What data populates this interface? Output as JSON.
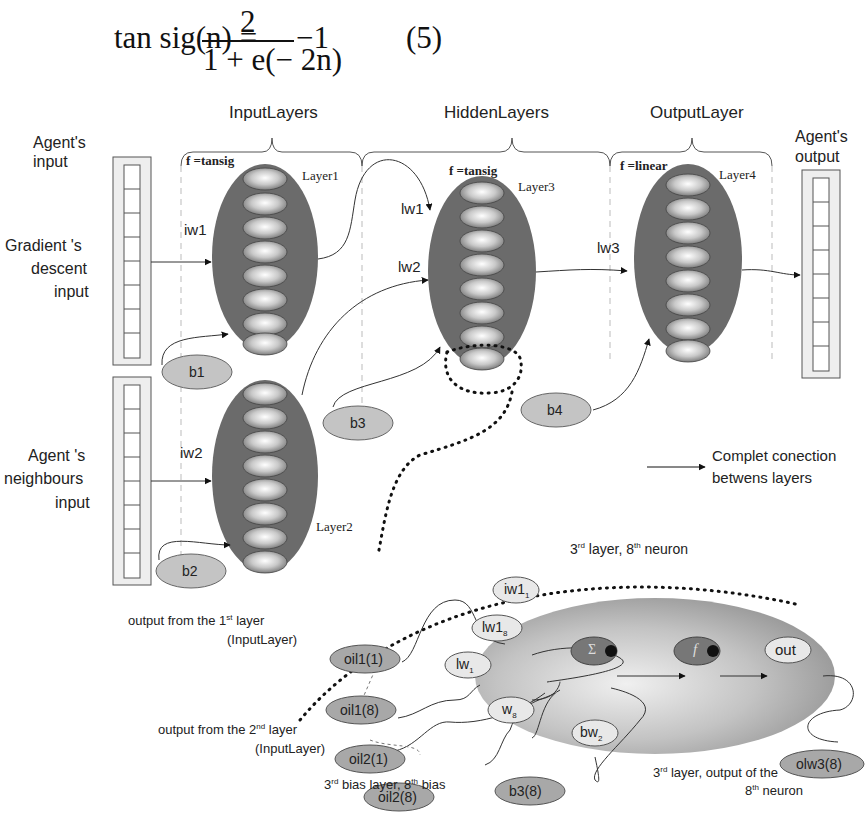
{
  "equation": {
    "lhs": "tan sig(n) =",
    "numerator": "2",
    "denominator": "1 + e(− 2n)",
    "tail": "−1",
    "number": "(5)"
  },
  "layer_groups": [
    {
      "label": "InputLayers"
    },
    {
      "label": "HiddenLayers"
    },
    {
      "label": "OutputLayer"
    }
  ],
  "io_labels": {
    "agent_input": "Agent's input",
    "agent_input_l1": "Agent's",
    "agent_input_l2": "input",
    "gradient_l1": "Gradient 's",
    "gradient_l2": "descent",
    "gradient_l3": "input",
    "neigh_l1": "Agent 's",
    "neigh_l2": "neighbours",
    "neigh_l3": "input",
    "agent_output_l1": "Agent's",
    "agent_output_l2": "output"
  },
  "layers": [
    {
      "name": "Layer1",
      "transfer": "f =tansig",
      "neurons": 8
    },
    {
      "name": "Layer2",
      "transfer": "",
      "neurons": 8
    },
    {
      "name": "Layer3",
      "transfer": "f =tansig",
      "neurons": 8
    },
    {
      "name": "Layer4",
      "transfer": "f =linear",
      "neurons": 8
    }
  ],
  "weights": {
    "iw1": "iw1",
    "iw2": "iw2",
    "lw1": "lw1",
    "lw2": "lw2",
    "lw3": "lw3"
  },
  "biases": [
    "b1",
    "b2",
    "b3",
    "b4"
  ],
  "legend": {
    "line1": "Complet conection",
    "line2": "betwens layers"
  },
  "detail": {
    "title_pre": "3",
    "title_sup1": "rd",
    "title_mid": " layer, 8",
    "title_sup2": "th",
    "title_post": "  neuron",
    "inputs": [
      "oil1(1)",
      "oil1(8)",
      "oil2(1)",
      "oil2(8)",
      "b3(8)"
    ],
    "weights": {
      "iw1_1": "iw1",
      "iw1_1_sub": "1",
      "lw1_8": "lw1",
      "lw1_8_sub": "8",
      "lw_1": "lw",
      "lw_1_sub": "1",
      "w_8": "w",
      "w_8_sub": "8",
      "bw_2": "bw",
      "bw_2_sub": "2"
    },
    "sum_symbol": "Σ",
    "func_symbol": "f",
    "out": "out",
    "output_node": "olw3(8)",
    "caption_out1_a": "output from the 1",
    "caption_out1_sup": "st",
    "caption_out1_b": " layer",
    "caption_out1_c": "(InputLayer)",
    "caption_out2_a": "output from the 2",
    "caption_out2_sup": "nd",
    "caption_out2_b": "  layer",
    "caption_out2_c": "(InputLayer)",
    "caption_bias_a": "3",
    "caption_bias_sup1": "rd",
    "caption_bias_b": " bias layer, 8",
    "caption_bias_sup2": "th",
    "caption_bias_c": " bias",
    "caption_result_a": "3",
    "caption_result_sup1": "rd",
    "caption_result_b": " layer, output of the",
    "caption_result_c": "8",
    "caption_result_sup2": "th",
    "caption_result_d": " neuron"
  },
  "colors": {
    "layer_fill": "#6b6b6b",
    "bias_fill": "#c4c4c4",
    "node_fill": "#e6e6e6",
    "detail_bg": "#b0b0b0",
    "sum_fill": "#7a7a7a"
  }
}
